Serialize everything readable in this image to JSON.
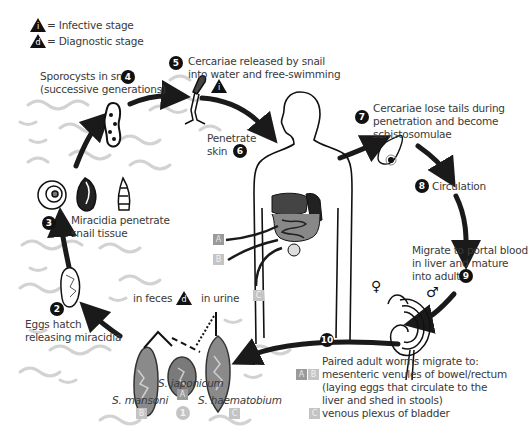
{
  "legend": {
    "infective": {
      "symbol": "i",
      "label": "= Infective stage"
    },
    "diagnostic": {
      "symbol": "d",
      "label": "= Diagnostic stage"
    }
  },
  "steps": [
    {
      "n": "1",
      "label": ""
    },
    {
      "n": "2",
      "label": "Eggs hatch\nreleasing miracidia"
    },
    {
      "n": "3",
      "label": "Miracidia penetrate\nsnail tissue"
    },
    {
      "n": "4",
      "label": "Sporocysts in snail\n(successive generations)"
    },
    {
      "n": "5",
      "label": "Cercariae released by snail\ninto water and free-swimming"
    },
    {
      "n": "6",
      "label": "Penetrate\nskin"
    },
    {
      "n": "7",
      "label": "Cercariae lose tails during\npenetration and become\nschistosomulae"
    },
    {
      "n": "8",
      "label": "Circulation"
    },
    {
      "n": "9",
      "label": "Migrate to portal blood\nin liver and mature\ninto adults"
    },
    {
      "n": "10",
      "label": ""
    }
  ],
  "step_text": {
    "s2_line1": "Eggs hatch",
    "s2_line2": "releasing miracidia",
    "s3_line1": "Miracidia penetrate",
    "s3_line2": "snail tissue",
    "s4_line1": "Sporocysts in snail",
    "s4_line2": "(successive generations)",
    "s5_line1": "Cercariae released by snail",
    "s5_line2": "into water and free-swimming",
    "s6_line1": "Penetrate",
    "s6_line2": "skin",
    "s7_line1": "Cercariae lose tails during",
    "s7_line2": "penetration and become",
    "s7_line3": "schistosomulae",
    "s8": "Circulation",
    "s9_line1": "Migrate to portal blood",
    "s9_line2": "in liver and mature",
    "s9_line3": "into adults",
    "s10_line1": "Paired adult worms migrate to:",
    "s10_line2": "mesenteric venules of bowel/rectum",
    "s10_line3": "(laying eggs that circulate to the",
    "s10_line4": "liver and shed in stools)",
    "s10_line5": "venous plexus of bladder"
  },
  "eggs": {
    "in_feces": "in feces",
    "in_urine": "in urine",
    "species": [
      {
        "name": "S. mansoni",
        "tag": "B"
      },
      {
        "name": "S. japonicum",
        "tag": "A"
      },
      {
        "name": "S. haematobium",
        "tag": "C"
      }
    ],
    "extra_num": "1"
  },
  "site_tags": {
    "a": "A",
    "b": "B",
    "c": "C"
  },
  "symbols": {
    "male": "♂",
    "female": "♀"
  },
  "colors": {
    "badge": "#111111",
    "tag": "#9a9a9a",
    "arrow": "#1a1a1a",
    "water": "#cfcfcf"
  }
}
